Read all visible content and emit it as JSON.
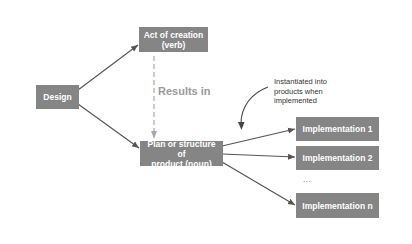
{
  "diagram": {
    "nodes": {
      "design": {
        "label": "Design"
      },
      "act_of_creation": {
        "line1": "Act of creation",
        "line2": "(verb)"
      },
      "plan_structure": {
        "line1": "Plan or structure of",
        "line2": "product (noun)"
      },
      "implementation_1": {
        "label": "Implementation 1"
      },
      "implementation_2": {
        "label": "Implementation 2"
      },
      "ellipsis": {
        "label": "..."
      },
      "implementation_n": {
        "label": "Implementation n"
      }
    },
    "edge_labels": {
      "results_in": "Results in",
      "annotation_line1": "Instantiated into",
      "annotation_line2": "products when",
      "annotation_line3": "implemented"
    },
    "edges": [
      {
        "from": "design",
        "to": "act_of_creation",
        "style": "solid-arrow"
      },
      {
        "from": "design",
        "to": "plan_structure",
        "style": "solid-arrow"
      },
      {
        "from": "act_of_creation",
        "to": "plan_structure",
        "style": "dashed-arrow",
        "label": "Results in"
      },
      {
        "from": "plan_structure",
        "to": "implementation_1",
        "style": "solid-arrow"
      },
      {
        "from": "plan_structure",
        "to": "implementation_2",
        "style": "solid-arrow"
      },
      {
        "from": "plan_structure",
        "to": "implementation_n",
        "style": "solid-arrow"
      },
      {
        "from": "annotation",
        "to": "plan_structure_edges",
        "style": "curved-arrow"
      }
    ],
    "colors": {
      "box_fill": "#858585",
      "box_text": "#ffffff",
      "arrow": "#555555",
      "dashed_arrow": "#a8a8a8",
      "results_text": "#9a9a9a",
      "annotation_text": "#333333",
      "background": "#ffffff"
    }
  }
}
